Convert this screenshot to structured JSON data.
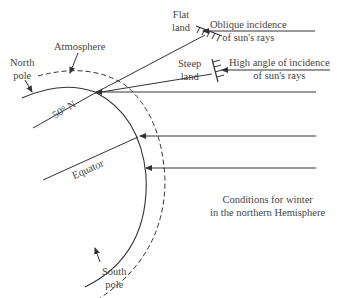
{
  "labels": {
    "flat_land": [
      "Flat",
      "land"
    ],
    "oblique": [
      "Oblique incidence",
      "of sun's rays"
    ],
    "atmosphere": "Atmosphere",
    "north_pole": [
      "North",
      "pole"
    ],
    "steep_land": [
      "Steep",
      "land"
    ],
    "high_angle": [
      "High angle of incidence",
      "of sun's rays"
    ],
    "latitude": "50° N",
    "equator": "Equator",
    "caption": [
      "Conditions for winter",
      "in the northern Hemisphere"
    ],
    "south_pole": [
      "South",
      "pole"
    ]
  },
  "colors": {
    "line": "#333333",
    "text": "#444444"
  }
}
